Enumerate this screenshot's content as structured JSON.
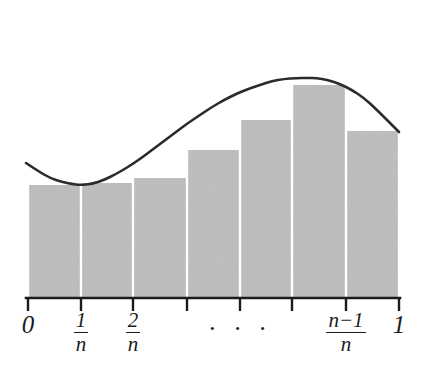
{
  "figure": {
    "kind": "riemann-sum-diagram",
    "background_color": "#ffffff",
    "bar_fill_color": "#c2c2c2",
    "bar_gap_color": "#ffffff",
    "curve_color": "#2b2b2b",
    "axis_color": "#1b1b1b"
  },
  "axis": {
    "baseline_y": 298,
    "x_start": 26,
    "x_end": 400,
    "tick_length": 13,
    "tick_positions": [
      28,
      81,
      133,
      187,
      240,
      292,
      346,
      399
    ],
    "labels": [
      {
        "id": "label-0",
        "type": "integer",
        "text": "0",
        "x": 28,
        "y": 312
      },
      {
        "id": "label-1-over-n",
        "type": "fraction",
        "num": "1",
        "den": "n",
        "x": 81,
        "y": 310
      },
      {
        "id": "label-2-over-n",
        "type": "fraction",
        "num": "2",
        "den": "n",
        "x": 133,
        "y": 310
      },
      {
        "id": "label-ellipsis",
        "type": "ellipsis",
        "text": "· · ·",
        "x": 240,
        "y": 316
      },
      {
        "id": "label-n-minus-1-over-n",
        "type": "fraction",
        "num": "n−1",
        "den": "n",
        "x": 346,
        "y": 310
      },
      {
        "id": "label-1",
        "type": "integer",
        "text": "1",
        "x": 399,
        "y": 312
      }
    ]
  },
  "chart_data": {
    "type": "bar",
    "title": "",
    "xlabel": "",
    "ylabel": "",
    "grid": false,
    "legend": null,
    "categories": [
      "0",
      "1/n",
      "2/n",
      "3/n",
      "...",
      "(n-2)/n",
      "(n-1)/n"
    ],
    "bar_edges_px": [
      28,
      81,
      133,
      187,
      240,
      292,
      346,
      399
    ],
    "bar_tops_px": [
      185,
      183,
      178,
      150,
      120,
      85,
      131
    ],
    "baseline_px": 298,
    "values": [
      0.35,
      0.36,
      0.4,
      0.62,
      0.84,
      1.11,
      0.78
    ],
    "ylim": [
      0,
      1.3
    ],
    "xlim": [
      0,
      1
    ],
    "series": [
      {
        "name": "Riemann rectangles",
        "values": [
          0.35,
          0.36,
          0.4,
          0.62,
          0.84,
          1.11,
          0.78
        ]
      },
      {
        "name": "curve f(x)",
        "type": "line",
        "points_px": [
          [
            26,
            163
          ],
          [
            38,
            171
          ],
          [
            50,
            178
          ],
          [
            62,
            182
          ],
          [
            72,
            184
          ],
          [
            80,
            185
          ],
          [
            92,
            184
          ],
          [
            104,
            180
          ],
          [
            116,
            174
          ],
          [
            128,
            167
          ],
          [
            140,
            159
          ],
          [
            152,
            150
          ],
          [
            164,
            141
          ],
          [
            176,
            132
          ],
          [
            188,
            123
          ],
          [
            200,
            115
          ],
          [
            212,
            107
          ],
          [
            224,
            100
          ],
          [
            236,
            94
          ],
          [
            248,
            89
          ],
          [
            260,
            85
          ],
          [
            272,
            81
          ],
          [
            284,
            79
          ],
          [
            296,
            78
          ],
          [
            308,
            78
          ],
          [
            316,
            78
          ],
          [
            328,
            80
          ],
          [
            340,
            84
          ],
          [
            352,
            90
          ],
          [
            364,
            98
          ],
          [
            376,
            109
          ],
          [
            388,
            121
          ],
          [
            399,
            132
          ]
        ]
      }
    ]
  }
}
